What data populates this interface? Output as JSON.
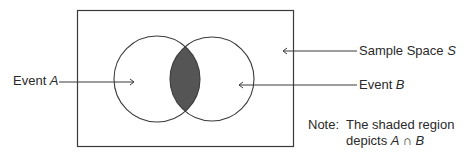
{
  "diagram": {
    "type": "venn",
    "sample_space": {
      "label_text": "Sample Space ",
      "label_symbol": "S"
    },
    "event_a": {
      "label_text": "Event ",
      "label_symbol": "A"
    },
    "event_b": {
      "label_text": "Event ",
      "label_symbol": "B"
    },
    "note": {
      "prefix": "Note:",
      "line1": "The shaded region",
      "line2_text": "depicts ",
      "line2_expr": "A ∩ B"
    },
    "colors": {
      "stroke": "#3a3a3a",
      "shaded": "#555555",
      "background": "#ffffff"
    },
    "shaded_region": "A ∩ B"
  }
}
